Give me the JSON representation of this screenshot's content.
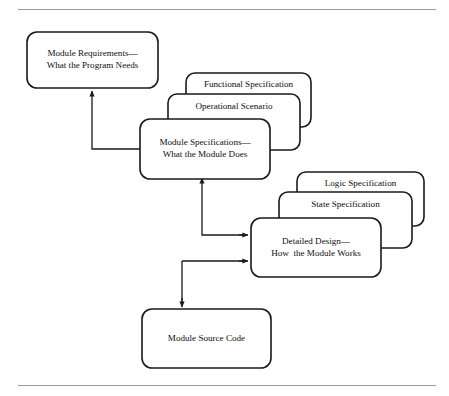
{
  "figure": {
    "background_color": "#ffffff",
    "line_color": "#1a1a1a",
    "rule_color": "#9a9a9a"
  },
  "rules": {
    "top_rule": "horizontal-rule-top",
    "bottom_rule": "horizontal-rule-bottom"
  },
  "nodes": {
    "module_requirements": {
      "line1": "Module Requirements—",
      "line2": "What the Program Needs"
    },
    "functional_specification": {
      "line1": "Functional Specification"
    },
    "operational_scenario": {
      "line1": "Operational Scenario"
    },
    "module_specifications": {
      "line1": "Module Specifications—",
      "line2": "What the Module Does"
    },
    "logic_specification": {
      "line1": "Logic Specification"
    },
    "state_specification": {
      "line1": "State Specification"
    },
    "detailed_design": {
      "line1": "Detailed Design—",
      "line2": "How  the Module Works"
    },
    "module_source_code": {
      "line1": "Module Source Code"
    }
  },
  "connectors": [
    {
      "name": "module-specifications-to-module-requirements",
      "from": "module_specifications",
      "to": "module_requirements",
      "direction": "up"
    },
    {
      "name": "module-specifications-to-detailed-design",
      "from": "module_specifications",
      "to": "detailed_design",
      "direction": "right"
    },
    {
      "name": "detailed-design-to-module-specifications",
      "from": "detailed_design",
      "to": "module_specifications",
      "direction": "up"
    },
    {
      "name": "detailed-design-to-module-source-code",
      "from": "detailed_design",
      "to": "module_source_code",
      "direction": "down"
    }
  ]
}
